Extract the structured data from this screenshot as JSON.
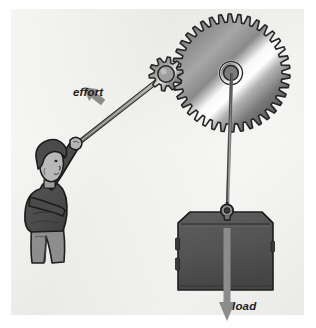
{
  "figure": {
    "title_text": "",
    "type": "mechanical-advantage-gear-diagram",
    "background_color": "#ffffff",
    "panel_color": "#ededea",
    "panel": {
      "x": 11,
      "y": 9,
      "width": 293,
      "height": 306
    }
  },
  "labels": {
    "effort": "effort",
    "load": "load"
  },
  "colors": {
    "ink": "#1b1b1b",
    "outline": "#2a2a2a",
    "arrow_gray": "#8c8c8c",
    "gear_metal_light": "#ffffff",
    "gear_metal_mid": "#9a9a9a",
    "gear_metal_dark": "#4f4f4f",
    "block_fill": "#535353",
    "block_dark": "#3f3f3f",
    "jacket": "#4c4c4c",
    "pants": "#8a8a8a",
    "hair": "#4a4a4a",
    "skin": "#b9b9b9",
    "rod": "#8e8e8e"
  },
  "components": {
    "large_gear": {
      "name": "large gear",
      "center_x": 231,
      "center_y": 73,
      "outer_radius": 59,
      "root_radius": 51,
      "tooth_count": 38,
      "hub_outer_radius": 11,
      "hub_inner_radius": 7
    },
    "small_gear": {
      "name": "small pinion gear",
      "center_x": 166,
      "center_y": 74,
      "outer_radius": 17,
      "root_radius": 12,
      "tooth_count": 10,
      "hub_radius": 8
    },
    "lever_rod": {
      "name": "effort lever rod",
      "from_x": 163,
      "from_y": 76,
      "to_x": 78,
      "to_y": 143
    },
    "cable": {
      "name": "load cable",
      "top_x": 231,
      "top_y": 73,
      "bottom_x": 227,
      "bottom_y": 211
    },
    "load_block": {
      "name": "load block",
      "left": 178,
      "top": 212,
      "width": 95,
      "height": 78,
      "bevel": 12
    },
    "hook": {
      "name": "load hook",
      "x": 227,
      "y": 210,
      "radius": 6
    },
    "person": {
      "name": "person pulling lever",
      "head_x": 45,
      "head_y": 168
    },
    "effort_arrow": {
      "name": "effort force arrow",
      "from_x": 102,
      "from_y": 99,
      "to_x": 88,
      "to_y": 117,
      "direction": "down-left"
    },
    "load_arrow": {
      "name": "load force arrow",
      "from_x": 227,
      "from_y": 228,
      "to_x": 227,
      "to_y": 322,
      "direction": "down"
    }
  }
}
